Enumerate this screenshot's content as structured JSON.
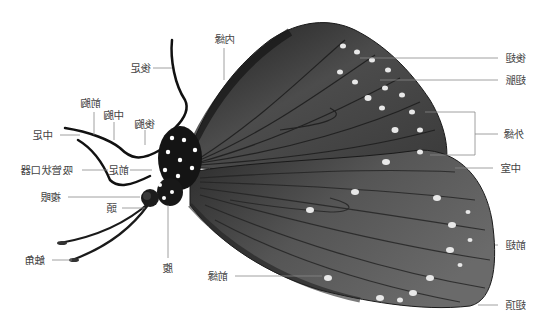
{
  "diagram": {
    "title": "",
    "colors": {
      "background": "#ffffff",
      "wing_dark": "#2e2e2e",
      "wing_mid": "#4a4a4a",
      "wing_light": "#6a6a6a",
      "vein": "#1e1e1e",
      "spot": "#e6e6e6",
      "body": "#141414",
      "leader_line": "#777777",
      "label_text": "#444444"
    },
    "labels": {
      "hind_leg": "後足",
      "inner_margin": "内縁",
      "metathorax": "後胸",
      "mesothorax": "中胸",
      "prothorax": "前胸",
      "middle_leg": "中足",
      "foreleg": "前足",
      "proboscis": "吸管状口器",
      "compound_eye": "複眼",
      "head": "頭",
      "antenna": "触角",
      "abdomen": "腹",
      "costa": "前縁",
      "hindwing": "後翅",
      "vein": "翅脈",
      "outer_margin": "外縁",
      "discal_cell": "中室",
      "forewing": "前翅",
      "apex": "翅頂"
    }
  }
}
